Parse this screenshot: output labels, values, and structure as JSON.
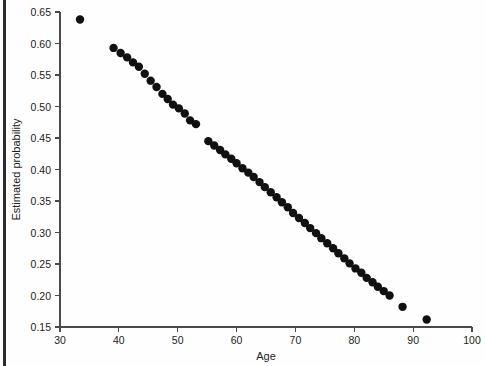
{
  "chart_data": {
    "type": "scatter",
    "title": "",
    "xlabel": "Age",
    "ylabel": "Estimated probability",
    "xlim": [
      30,
      100
    ],
    "ylim": [
      0.15,
      0.65
    ],
    "xticks": [
      30,
      40,
      50,
      60,
      70,
      80,
      90,
      100
    ],
    "xtick_labels": [
      "30",
      "40",
      "50",
      "60",
      "70",
      "80",
      "90",
      "100"
    ],
    "yticks": [
      0.15,
      0.2,
      0.25,
      0.3,
      0.35,
      0.4,
      0.45,
      0.5,
      0.55,
      0.6,
      0.65
    ],
    "ytick_labels": [
      "0.15",
      "0.20",
      "0.25",
      "0.30",
      "0.35",
      "0.40",
      "0.45",
      "0.50",
      "0.55",
      "0.60",
      "0.65"
    ],
    "grid": false,
    "legend": null,
    "marker": "filled-circle",
    "marker_color": "#111111",
    "marker_size": 4.2,
    "x": [
      33.4,
      39.1,
      40.3,
      41.4,
      42.4,
      43.4,
      44.4,
      45.4,
      46.4,
      47.4,
      48.3,
      49.2,
      50.2,
      51.2,
      52.1,
      53.1,
      55.2,
      56.2,
      57.2,
      58.1,
      59.1,
      60.0,
      61.0,
      62.0,
      62.9,
      63.9,
      64.8,
      65.8,
      66.8,
      67.7,
      68.7,
      69.6,
      70.6,
      71.6,
      72.5,
      73.5,
      74.4,
      75.4,
      76.4,
      77.3,
      78.3,
      79.2,
      80.2,
      81.2,
      82.1,
      83.1,
      84.0,
      85.0,
      86.0,
      88.2,
      92.3
    ],
    "y": [
      0.638,
      0.593,
      0.585,
      0.578,
      0.57,
      0.563,
      0.552,
      0.541,
      0.531,
      0.52,
      0.512,
      0.503,
      0.497,
      0.489,
      0.478,
      0.472,
      0.445,
      0.438,
      0.431,
      0.424,
      0.417,
      0.41,
      0.402,
      0.395,
      0.388,
      0.38,
      0.372,
      0.364,
      0.356,
      0.348,
      0.34,
      0.331,
      0.323,
      0.315,
      0.307,
      0.299,
      0.291,
      0.283,
      0.275,
      0.267,
      0.259,
      0.251,
      0.243,
      0.236,
      0.228,
      0.221,
      0.214,
      0.207,
      0.2,
      0.182,
      0.162
    ],
    "plot_box_px": {
      "left": 60,
      "right": 472,
      "top": 12,
      "bottom": 327
    }
  }
}
